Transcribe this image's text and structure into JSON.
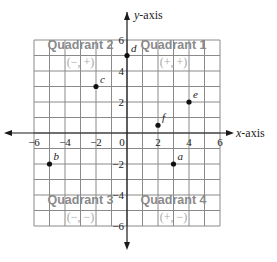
{
  "diagram": {
    "type": "coordinate-plane",
    "x_axis_label": "x-axis",
    "x_axis_label_prefix": "x",
    "x_axis_label_suffix": "-axis",
    "y_axis_label": "y-axis",
    "y_axis_label_prefix": "y",
    "y_axis_label_suffix": "-axis",
    "x_range": [
      -6,
      6
    ],
    "y_range": [
      -6,
      6
    ],
    "grid_step": 1,
    "x_tick_labels": [
      "−6",
      "−4",
      "−2",
      "0",
      "2",
      "4",
      "6"
    ],
    "y_tick_labels": [
      "6",
      "4",
      "2",
      "−2",
      "−4",
      "−6"
    ],
    "origin_label": "0",
    "quadrants": [
      {
        "name": "Quadrant 1",
        "signs": "(+, +)"
      },
      {
        "name": "Quadrant 2",
        "signs": "(−, +)"
      },
      {
        "name": "Quadrant 3",
        "signs": "(−, −)"
      },
      {
        "name": "Quadrant 4",
        "signs": "(+, −)"
      }
    ],
    "points": [
      {
        "label": "a",
        "x": 3,
        "y": -2
      },
      {
        "label": "b",
        "x": -5,
        "y": -2
      },
      {
        "label": "c",
        "x": -2,
        "y": 3
      },
      {
        "label": "d",
        "x": 0,
        "y": 5
      },
      {
        "label": "e",
        "x": 4,
        "y": 2
      },
      {
        "label": "f",
        "x": 2,
        "y": 0.5
      }
    ],
    "colors": {
      "grid": "#8a8a8a",
      "axis": "#1a1a1a",
      "quadrant_label": "#8a8a8a",
      "quadrant_signs": "#a8a8a8",
      "point": "#111111"
    }
  }
}
